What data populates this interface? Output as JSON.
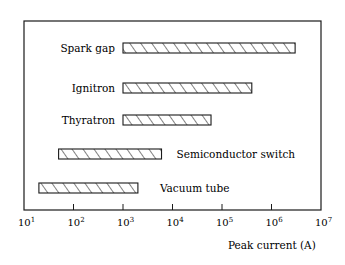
{
  "chart_data": {
    "type": "bar",
    "orientation": "horizontal-range",
    "title": "",
    "xlabel": "Peak current (A)",
    "ylabel": "",
    "xscale": "log",
    "xlim": [
      10,
      10000000
    ],
    "grid": false,
    "legend": null,
    "x_ticks": [
      "10^1",
      "10^2",
      "10^3",
      "10^4",
      "10^5",
      "10^6",
      "10^7"
    ],
    "categories": [
      "Spark gap",
      "Ignitron",
      "Thyratron",
      "Semiconductor switch",
      "Vacuum tube"
    ],
    "series": [
      {
        "name": "Peak current range",
        "ranges": [
          {
            "label": "Spark gap",
            "min": 1000,
            "max": 3000000,
            "label_side": "left"
          },
          {
            "label": "Ignitron",
            "min": 1000,
            "max": 400000,
            "label_side": "left"
          },
          {
            "label": "Thyratron",
            "min": 1000,
            "max": 60000,
            "label_side": "left"
          },
          {
            "label": "Semiconductor switch",
            "min": 50,
            "max": 6000,
            "label_side": "right"
          },
          {
            "label": "Vacuum tube",
            "min": 20,
            "max": 2000,
            "label_side": "right"
          }
        ]
      }
    ],
    "fill_pattern": "diagonal-hatch"
  },
  "colors": {
    "ink": "#1a1a1a",
    "background": "#ffffff"
  }
}
